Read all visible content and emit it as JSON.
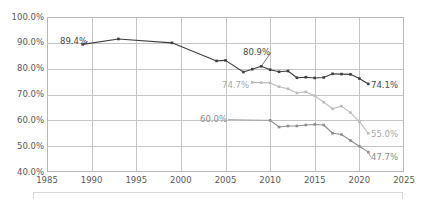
{
  "chart_data": {
    "type": "line",
    "title": "",
    "xlabel": "",
    "ylabel": "",
    "xlim": [
      1985,
      2025
    ],
    "ylim": [
      40.0,
      100.0
    ],
    "ytick_labels": [
      "100.0%",
      "90.0%",
      "80.0%",
      "70.0%",
      "60.0%",
      "50.0%",
      "40.0%"
    ],
    "ytick_values": [
      100.0,
      90.0,
      80.0,
      70.0,
      60.0,
      50.0,
      40.0
    ],
    "xtick_labels": [
      "1985",
      "1990",
      "1995",
      "2000",
      "2005",
      "2010",
      "2015",
      "2020",
      "2025"
    ],
    "xtick_values": [
      1985,
      1990,
      1995,
      2000,
      2005,
      2010,
      2015,
      2020,
      2025
    ],
    "grid": true,
    "legend": "none",
    "marker": "square",
    "series": [
      {
        "name": "series-dark",
        "color": "#3f3f3f",
        "x": [
          1989,
          1993,
          1999,
          2004,
          2005,
          2007,
          2008,
          2009,
          2010,
          2011,
          2012,
          2013,
          2014,
          2015,
          2016,
          2017,
          2018,
          2019,
          2020,
          2021
        ],
        "values": [
          89.4,
          91.5,
          90.0,
          83.0,
          83.2,
          78.7,
          79.8,
          80.9,
          79.6,
          78.8,
          79.1,
          76.5,
          76.7,
          76.4,
          76.6,
          78.0,
          77.9,
          77.8,
          76.2,
          74.1
        ]
      },
      {
        "name": "series-light",
        "color": "#bdbdbd",
        "x": [
          2008,
          2009,
          2010,
          2011,
          2012,
          2013,
          2014,
          2015,
          2016,
          2017,
          2018,
          2019,
          2020,
          2021
        ],
        "values": [
          74.7,
          74.6,
          74.5,
          73.0,
          72.2,
          70.6,
          71.0,
          69.5,
          67.0,
          64.5,
          65.5,
          63.0,
          59.5,
          55.0
        ]
      },
      {
        "name": "series-mid",
        "color": "#8f8f8f",
        "x": [
          2010,
          2011,
          2012,
          2013,
          2014,
          2015,
          2016,
          2017,
          2018,
          2019,
          2020,
          2021
        ],
        "values": [
          60.0,
          57.4,
          57.8,
          57.8,
          58.2,
          58.4,
          58.2,
          55.0,
          54.5,
          52.2,
          50.0,
          47.7
        ]
      }
    ],
    "annotations": [
      {
        "name": "label-89-4",
        "text": "89.4%",
        "series": "series-dark",
        "x": 1989,
        "value": 89.4,
        "left": 60,
        "top": 37,
        "tone": "dark"
      },
      {
        "name": "label-80-9",
        "text": "80.9%",
        "series": "series-dark",
        "x": 2009,
        "value": 80.9,
        "left": 243,
        "top": 48,
        "tone": "dark"
      },
      {
        "name": "label-74-1",
        "text": "74.1%",
        "series": "series-dark",
        "x": 2021,
        "value": 74.1,
        "left": 371,
        "top": 81,
        "tone": "dark"
      },
      {
        "name": "label-74-7",
        "text": "74.7%",
        "series": "series-light",
        "x": 2008,
        "value": 74.7,
        "left": 222,
        "top": 81,
        "tone": "light"
      },
      {
        "name": "label-55-0",
        "text": "55.0%",
        "series": "series-light",
        "x": 2021,
        "value": 55.0,
        "left": 371,
        "top": 130,
        "tone": "light"
      },
      {
        "name": "label-60-0",
        "text": "60.0%",
        "series": "series-mid",
        "x": 2010,
        "value": 60.0,
        "left": 200,
        "top": 115,
        "tone": "mid"
      },
      {
        "name": "label-47-7",
        "text": "47.7%",
        "series": "series-mid",
        "x": 2021,
        "value": 47.7,
        "left": 371,
        "top": 153,
        "tone": "mid"
      }
    ]
  }
}
